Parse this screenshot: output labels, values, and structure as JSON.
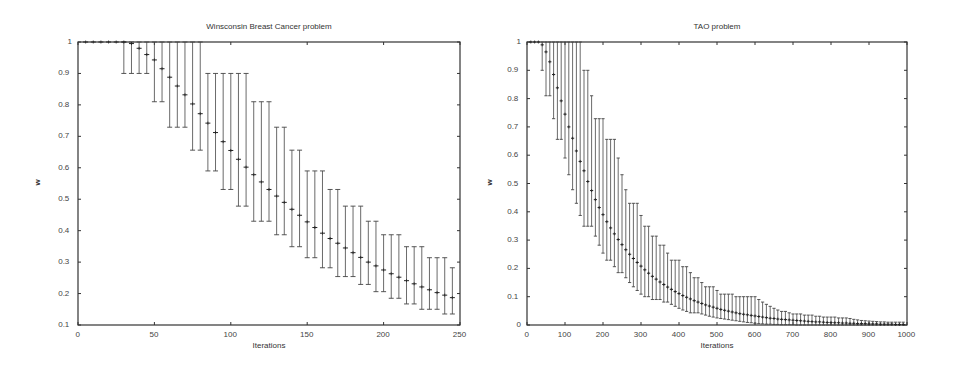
{
  "chart_data": [
    {
      "type": "line",
      "title": "Winsconsin Breast Cancer problem",
      "xlabel": "Iterations",
      "ylabel": "w",
      "xlim": [
        0,
        250
      ],
      "ylim": [
        0.1,
        1
      ],
      "xticks": [
        0,
        50,
        100,
        150,
        200,
        250
      ],
      "yticks": [
        0.1,
        0.2,
        0.3,
        0.4,
        0.5,
        0.6,
        0.7,
        0.8,
        0.9,
        1
      ],
      "ytick_labels": [
        "0.1",
        "0.2",
        "0.3",
        "0.4",
        "0.5",
        "0.6",
        "0.7",
        "0.8",
        "0.9",
        "1"
      ],
      "grid": false,
      "legend": null,
      "series": [
        {
          "name": "w (mean with min/max error bars)",
          "x": [
            5,
            10,
            15,
            20,
            25,
            30,
            35,
            40,
            45,
            50,
            55,
            60,
            65,
            70,
            75,
            80,
            85,
            90,
            95,
            100,
            105,
            110,
            115,
            120,
            125,
            130,
            135,
            140,
            145,
            150,
            155,
            160,
            165,
            170,
            175,
            180,
            185,
            190,
            195,
            200,
            205,
            210,
            215,
            220,
            225,
            230,
            235,
            240,
            245
          ],
          "mean": [
            1,
            1,
            1,
            1,
            1,
            1,
            0.995,
            0.98,
            0.96,
            0.943,
            0.915,
            0.888,
            0.86,
            0.832,
            0.803,
            0.772,
            0.742,
            0.712,
            0.683,
            0.655,
            0.627,
            0.602,
            0.578,
            0.555,
            0.531,
            0.51,
            0.49,
            0.468,
            0.449,
            0.428,
            0.41,
            0.392,
            0.375,
            0.36,
            0.345,
            0.33,
            0.315,
            0.3,
            0.288,
            0.275,
            0.263,
            0.252,
            0.241,
            0.231,
            0.221,
            0.212,
            0.203,
            0.195,
            0.187
          ],
          "low": [
            1,
            1,
            1,
            1,
            1,
            0.9,
            0.9,
            0.9,
            0.9,
            0.81,
            0.81,
            0.729,
            0.729,
            0.729,
            0.656,
            0.656,
            0.59,
            0.59,
            0.531,
            0.531,
            0.478,
            0.478,
            0.43,
            0.43,
            0.43,
            0.387,
            0.387,
            0.349,
            0.349,
            0.314,
            0.314,
            0.282,
            0.282,
            0.254,
            0.254,
            0.254,
            0.229,
            0.229,
            0.206,
            0.206,
            0.185,
            0.185,
            0.167,
            0.167,
            0.15,
            0.15,
            0.15,
            0.135,
            0.135
          ],
          "high": [
            1,
            1,
            1,
            1,
            1,
            1,
            1,
            1,
            1,
            1,
            1,
            1,
            1,
            1,
            1,
            1,
            0.9,
            0.9,
            0.9,
            0.9,
            0.9,
            0.9,
            0.81,
            0.81,
            0.81,
            0.729,
            0.729,
            0.656,
            0.656,
            0.59,
            0.59,
            0.59,
            0.531,
            0.531,
            0.478,
            0.478,
            0.478,
            0.43,
            0.43,
            0.387,
            0.387,
            0.387,
            0.349,
            0.349,
            0.349,
            0.314,
            0.314,
            0.314,
            0.282
          ]
        }
      ]
    },
    {
      "type": "line",
      "title": "TAO problem",
      "xlabel": "Iterations",
      "ylabel": "w",
      "xlim": [
        0,
        1000
      ],
      "ylim": [
        0,
        1
      ],
      "xticks": [
        0,
        100,
        200,
        300,
        400,
        500,
        600,
        700,
        800,
        900,
        1000
      ],
      "yticks": [
        0,
        0.1,
        0.2,
        0.3,
        0.4,
        0.5,
        0.6,
        0.7,
        0.8,
        0.9,
        1
      ],
      "ytick_labels": [
        "0",
        "0.1",
        "0.2",
        "0.3",
        "0.4",
        "0.5",
        "0.6",
        "0.7",
        "0.8",
        "0.9",
        "1"
      ],
      "grid": false,
      "legend": null,
      "series": [
        {
          "name": "w (mean with min/max error bars)",
          "x": [
            10,
            20,
            30,
            40,
            50,
            60,
            70,
            80,
            90,
            100,
            110,
            120,
            130,
            140,
            150,
            160,
            170,
            180,
            190,
            200,
            210,
            220,
            230,
            240,
            250,
            260,
            270,
            280,
            290,
            300,
            310,
            320,
            330,
            340,
            350,
            360,
            370,
            380,
            390,
            400,
            410,
            420,
            430,
            440,
            450,
            460,
            470,
            480,
            490,
            500,
            510,
            520,
            530,
            540,
            550,
            560,
            570,
            580,
            590,
            600,
            610,
            620,
            630,
            640,
            650,
            660,
            670,
            680,
            690,
            700,
            710,
            720,
            730,
            740,
            750,
            760,
            770,
            780,
            790,
            800,
            810,
            820,
            830,
            840,
            850,
            860,
            870,
            880,
            890,
            900,
            910,
            920,
            930,
            940,
            950,
            960,
            970,
            980,
            990
          ],
          "mean": [
            1,
            1,
            1,
            0.99,
            0.965,
            0.93,
            0.885,
            0.838,
            0.792,
            0.745,
            0.7,
            0.66,
            0.615,
            0.578,
            0.545,
            0.507,
            0.475,
            0.443,
            0.415,
            0.39,
            0.365,
            0.343,
            0.322,
            0.302,
            0.284,
            0.266,
            0.25,
            0.235,
            0.221,
            0.208,
            0.195,
            0.183,
            0.172,
            0.162,
            0.152,
            0.143,
            0.134,
            0.126,
            0.118,
            0.111,
            0.104,
            0.098,
            0.092,
            0.086,
            0.081,
            0.076,
            0.071,
            0.067,
            0.063,
            0.059,
            0.055,
            0.052,
            0.049,
            0.046,
            0.043,
            0.04,
            0.038,
            0.036,
            0.034,
            0.032,
            0.03,
            0.028,
            0.026,
            0.024,
            0.023,
            0.021,
            0.02,
            0.019,
            0.018,
            0.017,
            0.016,
            0.015,
            0.014,
            0.013,
            0.012,
            0.011,
            0.011,
            0.01,
            0.009,
            0.009,
            0.008,
            0.008,
            0.007,
            0.007,
            0.006,
            0.006,
            0.005,
            0.005,
            0.005,
            0.004,
            0.004,
            0.004,
            0.003,
            0.003,
            0.003,
            0.003,
            0.002,
            0.002,
            0.002
          ],
          "low": [
            1,
            1,
            1,
            0.9,
            0.81,
            0.81,
            0.729,
            0.656,
            0.656,
            0.59,
            0.531,
            0.478,
            0.43,
            0.387,
            0.349,
            0.349,
            0.349,
            0.314,
            0.282,
            0.254,
            0.229,
            0.229,
            0.206,
            0.185,
            0.185,
            0.167,
            0.15,
            0.135,
            0.122,
            0.109,
            0.1,
            0.1,
            0.09,
            0.09,
            0.09,
            0.081,
            0.081,
            0.073,
            0.066,
            0.059,
            0.053,
            0.048,
            0.043,
            0.043,
            0.043,
            0.039,
            0.035,
            0.031,
            0.028,
            0.025,
            0.023,
            0.021,
            0.019,
            0.017,
            0.015,
            0.013,
            0.011,
            0.009,
            0.008,
            0.006,
            0.005,
            0.004,
            0.003,
            0.003,
            0.002,
            0.002,
            0.001,
            0.001,
            0.001,
            0.001,
            0,
            0,
            0,
            0,
            0,
            0,
            0,
            0,
            0,
            0,
            0,
            0,
            0,
            0,
            0,
            0,
            0,
            0,
            0,
            0,
            0,
            0,
            0,
            0,
            0,
            0,
            0,
            0,
            0
          ],
          "high": [
            1,
            1,
            1,
            1,
            1,
            1,
            1,
            1,
            1,
            1,
            1,
            1,
            1,
            1,
            0.9,
            0.9,
            0.81,
            0.729,
            0.729,
            0.729,
            0.656,
            0.656,
            0.656,
            0.59,
            0.531,
            0.478,
            0.43,
            0.43,
            0.43,
            0.387,
            0.349,
            0.349,
            0.314,
            0.314,
            0.282,
            0.282,
            0.254,
            0.229,
            0.229,
            0.229,
            0.206,
            0.206,
            0.185,
            0.167,
            0.167,
            0.15,
            0.135,
            0.135,
            0.135,
            0.122,
            0.109,
            0.109,
            0.109,
            0.109,
            0.1,
            0.1,
            0.1,
            0.1,
            0.1,
            0.1,
            0.09,
            0.081,
            0.073,
            0.066,
            0.059,
            0.053,
            0.048,
            0.048,
            0.043,
            0.039,
            0.039,
            0.039,
            0.035,
            0.035,
            0.035,
            0.031,
            0.031,
            0.028,
            0.028,
            0.028,
            0.028,
            0.025,
            0.025,
            0.025,
            0.023,
            0.02,
            0.018,
            0.016,
            0.015,
            0.014,
            0.013,
            0.012,
            0.011,
            0.011,
            0.01,
            0.01,
            0.01,
            0.01,
            0.01
          ]
        }
      ]
    }
  ],
  "layout": {
    "charts": [
      {
        "plot_left": 78,
        "plot_top": 42,
        "plot_right": 460,
        "plot_bottom": 325,
        "title_x": 269,
        "title_y": 22,
        "xlabel_y": 341,
        "ylabel_x": 30,
        "ylabel_y": 178
      },
      {
        "plot_left": 527,
        "plot_top": 42,
        "plot_right": 907,
        "plot_bottom": 325,
        "title_x": 717,
        "title_y": 22,
        "xlabel_y": 341,
        "ylabel_x": 482,
        "ylabel_y": 178
      }
    ]
  }
}
